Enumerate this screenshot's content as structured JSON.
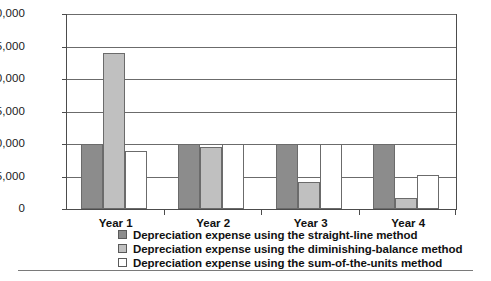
{
  "chart_data": {
    "type": "bar",
    "title": "",
    "subtitle": "",
    "xlabel": "",
    "ylabel": "",
    "categories": [
      "Year 1",
      "Year 2",
      "Year 3",
      "Year 4"
    ],
    "series": [
      {
        "name": "Depreciation expense using the straight-line method",
        "color": "#8c8c8c",
        "values": [
          10000,
          10000,
          10000,
          10000
        ]
      },
      {
        "name": "Depreciation expense using the diminishing-balance method",
        "color": "#c0c0c0",
        "values": [
          24000,
          9600,
          4200,
          1700
        ]
      },
      {
        "name": "Depreciation expense using the sum-of-the-units method",
        "color": "#ffffff",
        "values": [
          9000,
          10000,
          10000,
          5300
        ]
      }
    ],
    "ylim": [
      0,
      30000
    ],
    "ytick_values": [
      0,
      5000,
      10000,
      15000,
      20000,
      25000,
      30000
    ],
    "ytick_labels": [
      "0",
      "5,000",
      "10,000",
      "15,000",
      "20,000",
      "25,000",
      "30,000"
    ],
    "grid": true,
    "grid_axis": "y",
    "legend_position": "bottom-left",
    "legend": [
      {
        "label": "Depreciation expense using the straight-line method",
        "swatch_color": "#8c8c8c"
      },
      {
        "label": "Depreciation expense using the diminishing-balance method",
        "swatch_color": "#c0c0c0"
      },
      {
        "label": "Depreciation expense using the sum-of-the-units method",
        "swatch_color": "#ffffff"
      }
    ]
  }
}
